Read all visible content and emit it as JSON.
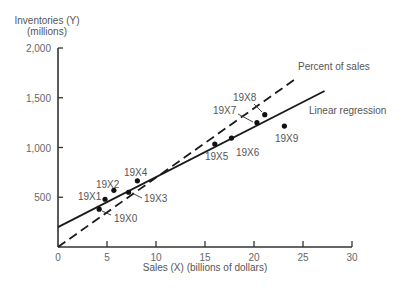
{
  "chart_data": {
    "type": "scatter",
    "title": "",
    "xlabel": "Sales (X) (billions of dollars)",
    "ylabel": "Inventories (Y) (millions)",
    "ylabel_lines": [
      "Inventories (Y)",
      "(millions)"
    ],
    "xlim": [
      0,
      30
    ],
    "ylim": [
      0,
      2000
    ],
    "x_ticks": [
      0,
      5,
      10,
      15,
      20,
      25,
      30
    ],
    "x_tick_labels": [
      "0",
      "5",
      "10",
      "15",
      "20",
      "25",
      "30"
    ],
    "y_ticks": [
      500,
      1000,
      1500,
      2000
    ],
    "y_tick_labels": [
      "500",
      "1,000",
      "1,500",
      "2,000"
    ],
    "grid": false,
    "points": [
      {
        "label": "19X0",
        "x": 4.2,
        "y": 380
      },
      {
        "label": "19X1",
        "x": 4.8,
        "y": 480
      },
      {
        "label": "19X2",
        "x": 5.7,
        "y": 570
      },
      {
        "label": "19X3",
        "x": 7.2,
        "y": 550
      },
      {
        "label": "19X4",
        "x": 8.1,
        "y": 665
      },
      {
        "label": "19X5",
        "x": 16.0,
        "y": 1035
      },
      {
        "label": "19X6",
        "x": 17.7,
        "y": 1095
      },
      {
        "label": "19X7",
        "x": 20.3,
        "y": 1250
      },
      {
        "label": "19X8",
        "x": 21.1,
        "y": 1330
      },
      {
        "label": "19X9",
        "x": 23.1,
        "y": 1215
      }
    ],
    "series": [
      {
        "name": "Linear regression",
        "style": "solid",
        "intercept": 200,
        "slope": 50.3,
        "x_range": [
          0,
          27.2
        ]
      },
      {
        "name": "Percent of sales",
        "style": "dashed",
        "intercept": 0,
        "slope": 69.7,
        "x_range": [
          0,
          24.4
        ]
      }
    ],
    "annotations": [
      "Percent of sales",
      "Linear regression"
    ]
  }
}
